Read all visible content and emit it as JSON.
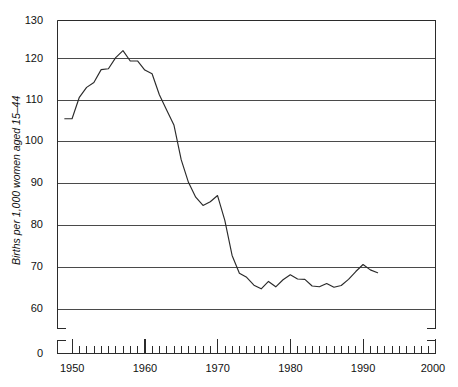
{
  "chart_data": {
    "type": "line",
    "title": "",
    "subtitle": "",
    "xlabel": "",
    "ylabel": "Births per 1,000 women aged 15–44",
    "xlim": [
      1948,
      2000
    ],
    "ylim": [
      0,
      130
    ],
    "y_plot_min": 55,
    "y_axis_break": true,
    "y_break_between": [
      0,
      55
    ],
    "grid": true,
    "grid_axis": "y",
    "legend": null,
    "legend_position": "none",
    "y_ticks": [
      0,
      60,
      70,
      80,
      90,
      100,
      110,
      120,
      130
    ],
    "y_tick_labels": [
      "0",
      "60",
      "70",
      "80",
      "90",
      "100",
      "110",
      "120",
      "130"
    ],
    "x_ticks_major": [
      1950,
      1960,
      1970,
      1980,
      1990,
      2000
    ],
    "x_tick_labels": [
      "1950",
      "1960",
      "1970",
      "1980",
      "1990",
      "2000"
    ],
    "x_minor_tick_step": 1,
    "series": [
      {
        "name": "General fertility rate",
        "x": [
          1949,
          1950,
          1951,
          1952,
          1953,
          1954,
          1955,
          1956,
          1957,
          1958,
          1959,
          1960,
          1961,
          1962,
          1963,
          1964,
          1965,
          1966,
          1967,
          1968,
          1969,
          1970,
          1971,
          1972,
          1973,
          1974,
          1975,
          1976,
          1977,
          1978,
          1979,
          1980,
          1981,
          1982,
          1983,
          1984,
          1985,
          1986,
          1987,
          1988,
          1989,
          1990,
          1991,
          1992
        ],
        "values": [
          106.2,
          106.2,
          111.4,
          113.8,
          115.0,
          118.1,
          118.3,
          121.0,
          122.7,
          120.2,
          120.2,
          118.0,
          117.1,
          112.0,
          108.3,
          104.7,
          96.3,
          90.8,
          87.2,
          85.2,
          86.1,
          87.6,
          81.6,
          73.1,
          68.8,
          67.8,
          65.9,
          65.0,
          66.8,
          65.5,
          67.2,
          68.4,
          67.4,
          67.3,
          65.7,
          65.5,
          66.3,
          65.4,
          65.8,
          67.3,
          69.2,
          70.9,
          69.6,
          68.9
        ]
      }
    ],
    "annotations": []
  },
  "axis": {
    "y_label": "Births per 1,000 women aged 15–44",
    "zero_label": "0"
  }
}
